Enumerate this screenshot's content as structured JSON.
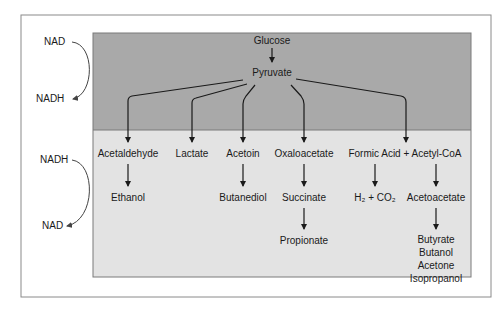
{
  "colors": {
    "frame": "#8a8a8a",
    "upper_panel": "#a9a9a9",
    "lower_panel": "#e3e3e3",
    "line": "#1a1a1a"
  },
  "cofactors": {
    "upper": {
      "from": "NAD",
      "to": "NADH"
    },
    "lower": {
      "from": "NADH",
      "to": "NAD"
    }
  },
  "nodes": {
    "glucose": "Glucose",
    "pyruvate": "Pyruvate",
    "acetaldehyde": "Acetaldehyde",
    "ethanol": "Ethanol",
    "lactate": "Lactate",
    "acetoin": "Acetoin",
    "butanediol": "Butanediol",
    "oxaloacetate": "Oxaloacetate",
    "succinate": "Succinate",
    "propionate": "Propionate",
    "formic_acid_acetyl_coa": "Formic Acid + Acetyl-CoA",
    "h2_co2": "H₂ + CO₂",
    "acetoacetate": "Acetoacetate",
    "butyrate": "Butyrate",
    "butanol": "Butanol",
    "acetone": "Acetone",
    "isopropanol": "Isopropanol"
  }
}
